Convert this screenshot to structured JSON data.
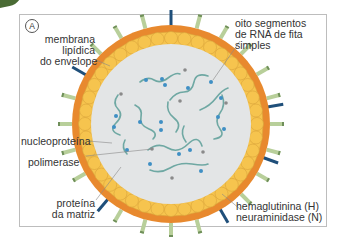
{
  "panel": {
    "badge": "A"
  },
  "labels": {
    "envelope": [
      "membrana",
      "lipídica",
      "do envelope"
    ],
    "rna": [
      "oito segmentos",
      "de RNA de fita",
      "simples"
    ],
    "nucleoprotein": "nucleoproteína",
    "polymerase": "polimerase",
    "matrix": [
      "proteína",
      "da matriz"
    ],
    "spikes": [
      "hemaglutinina (H)",
      "neuraminidase (N)"
    ]
  },
  "colors": {
    "envelope_outer": "#e8892e",
    "matrix_cells": "#f6c44e",
    "interior": "#e3e5e6",
    "hemagglutinin": "#b8cf9a",
    "neuraminidase": "#1f4f7a",
    "rna_strand": "#6fa8a3",
    "nucleoprotein_dot": "#3f8fc4",
    "polymerase_dot": "#8a8a8a"
  }
}
